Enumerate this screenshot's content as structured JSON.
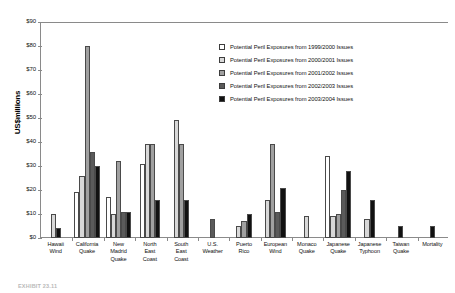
{
  "chart_data": {
    "type": "bar",
    "title": "",
    "xlabel": "",
    "ylabel": "US$millions",
    "ylim": [
      0,
      90
    ],
    "ytick_step": 10,
    "ytick_labels": [
      "$90",
      "$80",
      "$70",
      "$60",
      "$50",
      "$40",
      "$30",
      "$20",
      "$10",
      "$0"
    ],
    "ytick_values": [
      90,
      80,
      70,
      60,
      50,
      40,
      30,
      20,
      10,
      0
    ],
    "grid": false,
    "legend_position": "upper-right-inside",
    "categories": [
      "Hawaii Wind",
      "California Quake",
      "New Madrid Quake",
      "North East Coast",
      "South East Coast",
      "U.S. Weather",
      "Puerto Rico",
      "European Wind",
      "Monaco Quake",
      "Japanese Quake",
      "Japanese Typhoon",
      "Taiwan Quake",
      "Mortality"
    ],
    "category_lines": [
      [
        "Hawaii",
        "Wind"
      ],
      [
        "California",
        "Quake"
      ],
      [
        "New",
        "Madrid",
        "Quake"
      ],
      [
        "North",
        "East",
        "Coast"
      ],
      [
        "South",
        "East",
        "Coast"
      ],
      [
        "U.S.",
        "Weather"
      ],
      [
        "Puerto",
        "Rico"
      ],
      [
        "European",
        "Wind"
      ],
      [
        "Monaco",
        "Quake"
      ],
      [
        "Japanese",
        "Quake"
      ],
      [
        "Japanese",
        "Typhoon"
      ],
      [
        "Taiwan",
        "Quake"
      ],
      [
        "Mortality"
      ]
    ],
    "series": [
      {
        "name": "Potential Peril Exposures from 1999/2000 Issues",
        "color": "#ffffff",
        "values": [
          0,
          19,
          17,
          31,
          0,
          0,
          0,
          0,
          0,
          34,
          0,
          0,
          0
        ]
      },
      {
        "name": "Potential Peril Exposures from 2000/2001 Issues",
        "color": "#d8d8d8",
        "values": [
          10,
          26,
          10,
          39,
          49,
          0,
          5,
          16,
          9,
          9,
          8,
          0,
          0
        ]
      },
      {
        "name": "Potential Peril Exposures from 2001/2002 Issues",
        "color": "#a0a0a0",
        "values": [
          0,
          80,
          32,
          39,
          39,
          0,
          7,
          39,
          0,
          10,
          0,
          0,
          0
        ]
      },
      {
        "name": "Potential Peril Exposures from 2002/2003 Issues",
        "color": "#5a5a5a",
        "values": [
          0,
          36,
          11,
          0,
          0,
          8,
          0,
          11,
          0,
          20,
          0,
          0,
          0
        ]
      },
      {
        "name": "Potential Peril Exposures from 2003/2004 Issues",
        "color": "#111111",
        "values": [
          4,
          30,
          11,
          16,
          16,
          0,
          10,
          21,
          0,
          28,
          16,
          5,
          5
        ]
      }
    ]
  },
  "caption": "EXHIBIT 23.11"
}
